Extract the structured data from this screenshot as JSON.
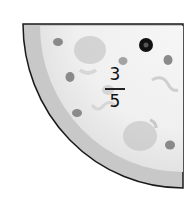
{
  "illustration": {
    "subject": "pizza slice (quarter circle)",
    "fraction": {
      "numerator": "3",
      "denominator": "5"
    },
    "colors": {
      "crust": "#c9c9c9",
      "cheese": "#ededed",
      "outline": "#1a1a1a",
      "topping_dark": "#111111",
      "topping_gray": "#8a8a8a"
    }
  }
}
